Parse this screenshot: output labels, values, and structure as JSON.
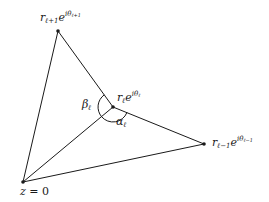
{
  "diagram": {
    "type": "geometric",
    "points": {
      "origin": {
        "x": 23,
        "y": 182,
        "label": "z = 0"
      },
      "top": {
        "x": 58,
        "y": 31,
        "label": "r_{l+1} e^{i theta_{l+1}}"
      },
      "middle": {
        "x": 113,
        "y": 107,
        "label": "r_l e^{i theta_l}"
      },
      "right": {
        "x": 204,
        "y": 144,
        "label": "r_{l-1} e^{i theta_{l-1}}"
      }
    },
    "edges": [
      [
        "origin",
        "top"
      ],
      [
        "top",
        "middle"
      ],
      [
        "middle",
        "right"
      ],
      [
        "right",
        "origin"
      ],
      [
        "origin",
        "middle"
      ]
    ],
    "angles": {
      "beta": {
        "label": "β",
        "sub": "ℓ",
        "at": "middle",
        "between": [
          "top",
          "origin"
        ]
      },
      "alpha": {
        "label": "α",
        "sub": "ℓ",
        "at": "middle",
        "between": [
          "origin",
          "right"
        ]
      }
    }
  },
  "labels": {
    "top": {
      "base": "r",
      "sub": "ℓ+1",
      "exp_base": "e",
      "exp": "iθ",
      "exp_sub": "ℓ+1"
    },
    "middle": {
      "base": "r",
      "sub": "ℓ",
      "exp_base": "e",
      "exp": "iθ",
      "exp_sub": "ℓ"
    },
    "right": {
      "base": "r",
      "sub": "ℓ−1",
      "exp_base": "e",
      "exp": "iθ",
      "exp_sub": "ℓ−1"
    },
    "origin": {
      "var": "z",
      "eq": " = ",
      "val": "0"
    },
    "beta": {
      "sym": "β",
      "sub": "ℓ"
    },
    "alpha": {
      "sym": "α",
      "sub": "ℓ"
    }
  },
  "colors": {
    "stroke": "#1a1a1a",
    "background": "#ffffff"
  }
}
